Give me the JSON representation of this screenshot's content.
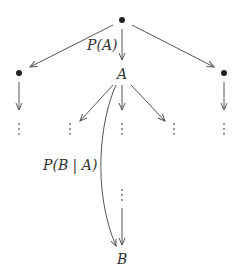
{
  "diagram": {
    "type": "probability-tree",
    "colors": {
      "edge": "#555555",
      "node": "#222222",
      "text": "#333333"
    },
    "nodes": {
      "root": {
        "label": "",
        "shape": "filled-dot"
      },
      "left": {
        "label": "",
        "shape": "filled-dot"
      },
      "right": {
        "label": "",
        "shape": "filled-dot"
      },
      "a": {
        "label": "A"
      },
      "b": {
        "label": "B"
      }
    },
    "edge_labels": {
      "root_to_a": "P(A)",
      "a_to_b": "P(B | A)"
    },
    "continuation_marker": "⋮"
  }
}
